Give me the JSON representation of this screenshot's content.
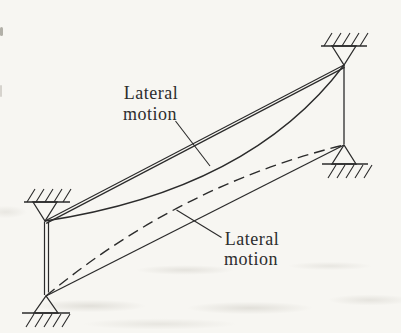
{
  "figure": {
    "labels": {
      "top": {
        "line1": "Lateral",
        "line2": "motion"
      },
      "bottom": {
        "line1": "Lateral",
        "line2": "motion"
      }
    }
  },
  "colors": {
    "line": "#2b2b2b",
    "text": "#2d2d2d",
    "paper": "#f7f6f2"
  }
}
